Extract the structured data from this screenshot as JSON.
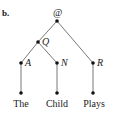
{
  "panel_label": "b.",
  "root": {
    "label": "@",
    "x": 57,
    "y": 21
  },
  "nodes": [
    {
      "id": "Q",
      "label": "Q",
      "x": 38,
      "y": 42
    },
    {
      "id": "A",
      "label": "A",
      "x": 21,
      "y": 63
    },
    {
      "id": "N",
      "label": "N",
      "x": 57,
      "y": 63
    },
    {
      "id": "R",
      "label": "R",
      "x": 93,
      "y": 63
    }
  ],
  "leaves": [
    {
      "label": "The",
      "x": 21,
      "y": 93
    },
    {
      "label": "Child",
      "x": 57,
      "y": 93
    },
    {
      "label": "Plays",
      "x": 93,
      "y": 93
    }
  ],
  "edges": [
    [
      "@",
      "Q"
    ],
    [
      "@",
      "R"
    ],
    [
      "Q",
      "A"
    ],
    [
      "Q",
      "N"
    ],
    [
      "A",
      "The"
    ],
    [
      "N",
      "Child"
    ],
    [
      "R",
      "Plays"
    ]
  ]
}
